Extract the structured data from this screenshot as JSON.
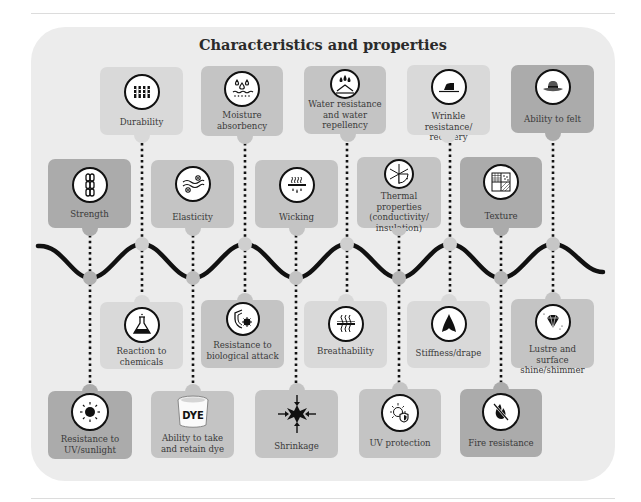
{
  "title": "Characteristics and properties",
  "colors": {
    "panel": "#ececec",
    "card_light": "#d9d9d9",
    "card_mid": "#c4c4c4",
    "card_dark": "#ababab",
    "wave": "#111111",
    "node": "#b8b8b8"
  },
  "properties": {
    "top": [
      {
        "label": "Durability",
        "icon": "fibres-icon"
      },
      {
        "label": "Moisture absorbency",
        "icon": "water-drops-icon"
      },
      {
        "label": "Water resistance and water repellency",
        "icon": "water-repel-icon"
      },
      {
        "label": "Wrinkle resistance/ recovery",
        "icon": "iron-icon"
      },
      {
        "label": "Ability to felt",
        "icon": "felt-hat-icon"
      }
    ],
    "upper": [
      {
        "label": "Strength",
        "icon": "chain-icon"
      },
      {
        "label": "Elasticity",
        "icon": "elastic-waves-icon"
      },
      {
        "label": "Wicking",
        "icon": "wicking-icon"
      },
      {
        "label": "Thermal properties (conductivity/ insulation)",
        "icon": "thermal-snowflake-sun-icon"
      },
      {
        "label": "Texture",
        "icon": "texture-swatch-icon"
      }
    ],
    "lower": [
      {
        "label": "Reaction to chemicals",
        "icon": "flask-icon"
      },
      {
        "label": "Resistance to biological attack",
        "icon": "shield-virus-icon"
      },
      {
        "label": "Breathability",
        "icon": "breathability-icon"
      },
      {
        "label": "Stiffness/drape",
        "icon": "drape-icon"
      },
      {
        "label": "Lustre and surface shine/shimmer",
        "icon": "diamond-icon"
      }
    ],
    "bottom": [
      {
        "label": "Resistance to UV/sunlight",
        "icon": "sun-icon"
      },
      {
        "label": "Ability to take and retain dye",
        "icon": "dye-bucket-icon",
        "icon_text": "DYE"
      },
      {
        "label": "Shrinkage",
        "icon": "shrink-arrows-icon"
      },
      {
        "label": "UV protection",
        "icon": "sun-shield-icon"
      },
      {
        "label": "Fire resistance",
        "icon": "no-fire-icon"
      }
    ]
  }
}
